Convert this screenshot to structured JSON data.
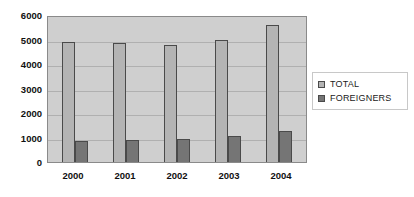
{
  "chart_data": {
    "type": "bar",
    "title": "",
    "subtitle": "",
    "xlabel": "",
    "ylabel": "",
    "categories": [
      "2000",
      "2001",
      "2002",
      "2003",
      "2004"
    ],
    "series": [
      {
        "name": "TOTAL",
        "color": "#b4b4b4",
        "values": [
          4900,
          4850,
          4780,
          4960,
          5600
        ]
      },
      {
        "name": "FOREIGNERS",
        "color": "#757575",
        "values": [
          850,
          880,
          950,
          1060,
          1260
        ]
      }
    ],
    "ylim": [
      0,
      6000
    ],
    "ytick_labels": [
      "0",
      "1000",
      "2000",
      "3000",
      "4000",
      "5000",
      "6000"
    ],
    "ytick_values": [
      0,
      1000,
      2000,
      3000,
      4000,
      5000,
      6000
    ],
    "grid": true,
    "legend_position": "right",
    "plot_background": "#cfcfcf",
    "grid_color": "#b0b0b0",
    "bar_outline_color": "#4a4a4a"
  },
  "legend": {
    "entries": [
      {
        "label": "TOTAL"
      },
      {
        "label": "FOREIGNERS"
      }
    ]
  }
}
